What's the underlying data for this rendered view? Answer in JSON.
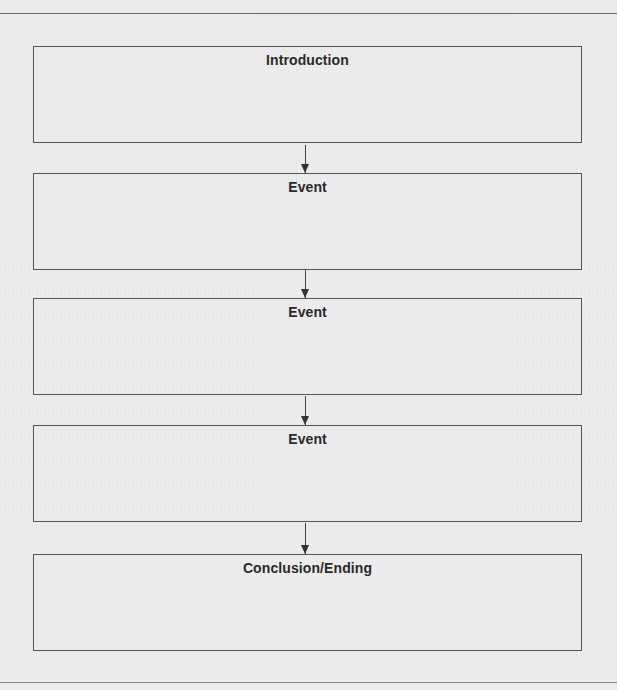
{
  "diagram": {
    "type": "sequence-flowchart",
    "boxes": [
      {
        "label": "Introduction"
      },
      {
        "label": "Event"
      },
      {
        "label": "Event"
      },
      {
        "label": "Event"
      },
      {
        "label": "Conclusion/Ending"
      }
    ],
    "connectors": [
      {
        "from": 0,
        "to": 1,
        "style": "arrow-down"
      },
      {
        "from": 1,
        "to": 2,
        "style": "arrow-down"
      },
      {
        "from": 2,
        "to": 3,
        "style": "arrow-down"
      },
      {
        "from": 3,
        "to": 4,
        "style": "arrow-down"
      }
    ],
    "colors": {
      "background": "#ebebeb",
      "border": "#555555",
      "text": "#2a2a2a"
    }
  }
}
